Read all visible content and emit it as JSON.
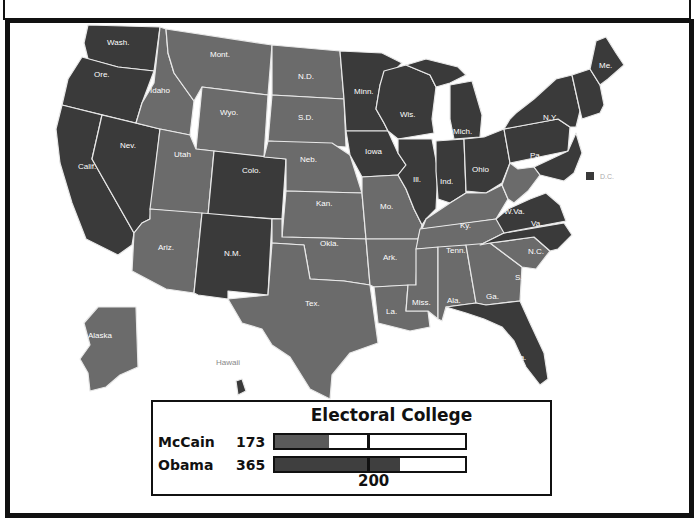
{
  "map": {
    "colors": {
      "obama": "#3a3a3a",
      "mccain": "#6b6b6b",
      "border": "#e8e8e8",
      "label": "#ffffff"
    },
    "states": [
      {
        "abbr": "Wash.",
        "winner": "obama"
      },
      {
        "abbr": "Ore.",
        "winner": "obama"
      },
      {
        "abbr": "Calif.",
        "winner": "obama"
      },
      {
        "abbr": "Nev.",
        "winner": "obama"
      },
      {
        "abbr": "Idaho",
        "winner": "mccain"
      },
      {
        "abbr": "Mont.",
        "winner": "mccain"
      },
      {
        "abbr": "Wyo.",
        "winner": "mccain"
      },
      {
        "abbr": "Utah",
        "winner": "mccain"
      },
      {
        "abbr": "Colo.",
        "winner": "obama"
      },
      {
        "abbr": "Ariz.",
        "winner": "mccain"
      },
      {
        "abbr": "N.M.",
        "winner": "obama"
      },
      {
        "abbr": "N.D.",
        "winner": "mccain"
      },
      {
        "abbr": "S.D.",
        "winner": "mccain"
      },
      {
        "abbr": "Neb.",
        "winner": "mccain"
      },
      {
        "abbr": "Kan.",
        "winner": "mccain"
      },
      {
        "abbr": "Okla.",
        "winner": "mccain"
      },
      {
        "abbr": "Tex.",
        "winner": "mccain"
      },
      {
        "abbr": "Minn.",
        "winner": "obama"
      },
      {
        "abbr": "Iowa",
        "winner": "obama"
      },
      {
        "abbr": "Mo.",
        "winner": "mccain"
      },
      {
        "abbr": "Ark.",
        "winner": "mccain"
      },
      {
        "abbr": "La.",
        "winner": "mccain"
      },
      {
        "abbr": "Wis.",
        "winner": "obama"
      },
      {
        "abbr": "Ill.",
        "winner": "obama"
      },
      {
        "abbr": "Mich.",
        "winner": "obama"
      },
      {
        "abbr": "Ind.",
        "winner": "obama"
      },
      {
        "abbr": "Ohio",
        "winner": "obama"
      },
      {
        "abbr": "Ky.",
        "winner": "mccain"
      },
      {
        "abbr": "Tenn.",
        "winner": "mccain"
      },
      {
        "abbr": "Miss.",
        "winner": "mccain"
      },
      {
        "abbr": "Ala.",
        "winner": "mccain"
      },
      {
        "abbr": "Ga.",
        "winner": "mccain"
      },
      {
        "abbr": "Fla.",
        "winner": "obama"
      },
      {
        "abbr": "S.C.",
        "winner": "mccain"
      },
      {
        "abbr": "N.C.",
        "winner": "obama"
      },
      {
        "abbr": "Va.",
        "winner": "obama"
      },
      {
        "abbr": "W.Va.",
        "winner": "mccain"
      },
      {
        "abbr": "Pa.",
        "winner": "obama"
      },
      {
        "abbr": "N.Y.",
        "winner": "obama"
      },
      {
        "abbr": "Me.",
        "winner": "obama"
      },
      {
        "abbr": "Alaska",
        "winner": "mccain"
      },
      {
        "abbr": "Hawaii",
        "winner": "obama"
      }
    ],
    "dc_legend": "D.C."
  },
  "electoral_college": {
    "title": "Electoral College",
    "threshold_label": "200",
    "threshold_value": 200,
    "max_value": 538,
    "candidates": [
      {
        "name": "McCain",
        "votes": "173",
        "value": 173
      },
      {
        "name": "Obama",
        "votes": "365",
        "value": 365
      }
    ]
  }
}
